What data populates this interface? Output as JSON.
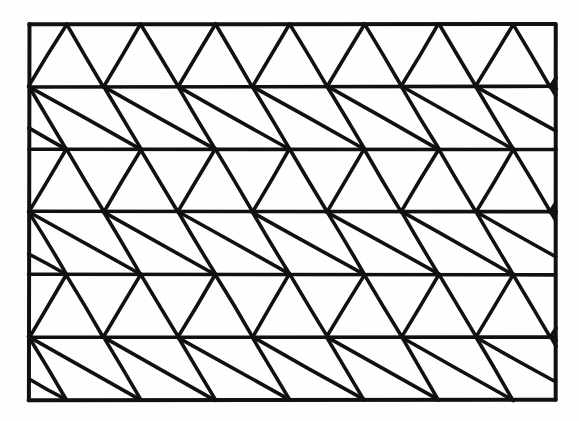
{
  "figure": {
    "background_color": "#ffffff",
    "ink_color": "#111111",
    "stroke_width_border": 4.0,
    "stroke_width_grid": 3.6,
    "frame": {
      "x": 29,
      "y": 24,
      "width": 527,
      "height": 376,
      "right": 556,
      "bottom": 400
    },
    "lattice": {
      "rows": 6,
      "columns": 7,
      "cell_width": 74.5,
      "row_height": 62.6,
      "half_offset": 37.25,
      "row_y_values": [
        24,
        86.6,
        149.2,
        211.8,
        274.4,
        337.0,
        400
      ],
      "apex_x_values": [
        66,
        140.5,
        215,
        289.5,
        364,
        438.5,
        513
      ],
      "offset_x_values": [
        28.75,
        103.25,
        177.75,
        252.25,
        326.75,
        401.25,
        475.75,
        550.25
      ],
      "row_parity": [
        "apex-up",
        "apex-down",
        "apex-up",
        "apex-down",
        "apex-up",
        "apex-down"
      ],
      "triangle_count": 84
    }
  }
}
